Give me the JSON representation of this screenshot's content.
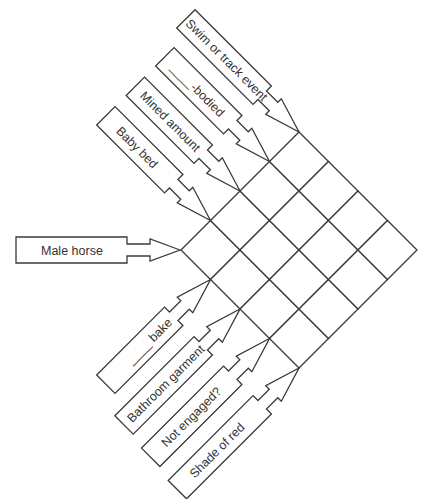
{
  "puzzle": {
    "type": "diamond-crossword",
    "grid": {
      "rows": 4,
      "cols": 4
    },
    "colors": {
      "line": "#3a3a3a",
      "text": "#333333",
      "background": "#ffffff"
    },
    "clues_upper": [
      {
        "id": "row-1",
        "text": "Baby bed"
      },
      {
        "id": "row-2",
        "text": "Mined amount"
      },
      {
        "id": "row-3",
        "text": "____-bodied"
      },
      {
        "id": "row-4",
        "text": "Swim or track event"
      }
    ],
    "clue_center": {
      "id": "center",
      "text": "Male horse"
    },
    "clues_lower": [
      {
        "id": "col-1",
        "text": "____ bake"
      },
      {
        "id": "col-2",
        "text": "Bathroom garment"
      },
      {
        "id": "col-3",
        "text": "Not engaged?"
      },
      {
        "id": "col-4",
        "text": "Shade of red"
      }
    ]
  }
}
